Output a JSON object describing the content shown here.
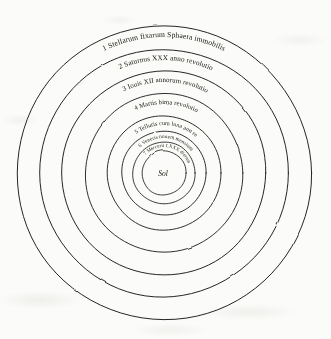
{
  "document": {
    "title": "Copernicus heliocentric system diagram",
    "center_label": "Sol",
    "ink_color": "#1c1a18",
    "paper_color": "#fbfbf9"
  },
  "orbits": [
    {
      "index": "1",
      "label": "1 Stellarum fixarum Sphaera immobilis",
      "body": "fixed stars",
      "radius": 147,
      "label_radius": 136,
      "font_size": 7.6,
      "sweep_deg": 86,
      "start_deg": -133
    },
    {
      "index": "2",
      "label": "2 Saturnus XXX anno revolutio",
      "body": "Saturn",
      "radius": 124,
      "label_radius": 113,
      "font_size": 7.2,
      "sweep_deg": 84,
      "start_deg": -131
    },
    {
      "index": "3",
      "label": "3 Iouis XII annorum revolutio",
      "body": "Jupiter",
      "radius": 102,
      "label_radius": 91,
      "font_size": 6.9,
      "sweep_deg": 86,
      "start_deg": -132
    },
    {
      "index": "4",
      "label": "4 Martis bima revolutio",
      "body": "Mars",
      "radius": 79,
      "label_radius": 69,
      "font_size": 6.5,
      "sweep_deg": 80,
      "start_deg": -128
    },
    {
      "index": "5",
      "label": "5 Telluris cum luna ann re",
      "body": "Earth and Moon",
      "radius": 57,
      "label_radius": 48,
      "font_size": 5.9,
      "sweep_deg": 86,
      "start_deg": -130
    },
    {
      "index": "6",
      "label": "6 Veneris nouem mensium",
      "body": "Venus",
      "radius": 42,
      "label_radius": 35,
      "font_size": 5.2,
      "sweep_deg": 96,
      "start_deg": -134
    },
    {
      "index": "7",
      "label": "7 Mercurii LXXX dierum",
      "body": "Mercury",
      "radius": 31,
      "label_radius": 26,
      "font_size": 4.8,
      "sweep_deg": 116,
      "start_deg": -137
    },
    {
      "index": "8",
      "label": "",
      "body": "Sun sphere",
      "radius": 22,
      "label_radius": 0,
      "font_size": 0,
      "sweep_deg": 0,
      "start_deg": 0
    }
  ],
  "geometry": {
    "center_x": 164,
    "center_y": 173,
    "sun_label_x": 163,
    "sun_label_y": 176,
    "sun_label_font_size": 7.5
  }
}
